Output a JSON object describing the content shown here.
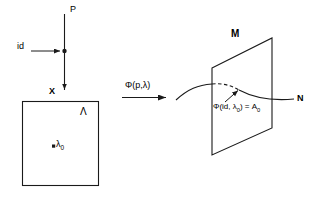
{
  "diagram": {
    "stroke_color": "#1a1a1a",
    "background_color": "#ffffff",
    "labels": {
      "fiber_top": "P",
      "section_id": "id",
      "base_point": "X",
      "base_space": "Λ",
      "base_point_lambda": "λ",
      "base_point_lambda_sub": "0",
      "map": "Φ(p,λ)",
      "manifold": "M",
      "curve": "N",
      "image_point_prefix": "Φ(id, λ",
      "image_point_sub1": "0",
      "image_point_mid": ") = A",
      "image_point_sub2": "0"
    }
  }
}
